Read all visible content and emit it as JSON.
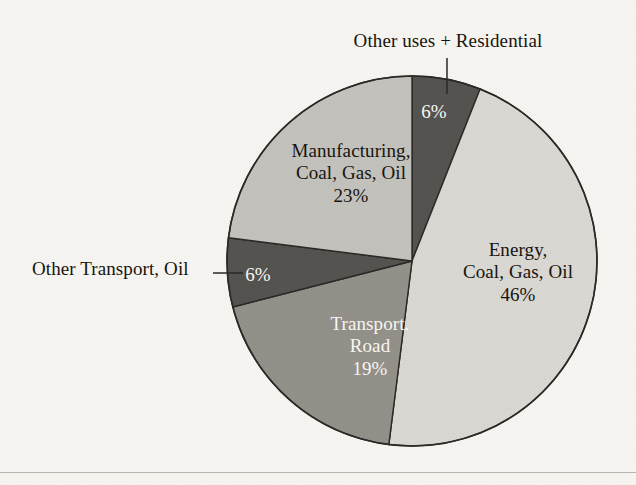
{
  "figure": {
    "background_color": "#f6f4f0",
    "outline_color": "#2c2a28"
  },
  "chart_data": {
    "type": "pie",
    "title": "",
    "units": "percent",
    "legend_position": "none",
    "labels_on_slices": true,
    "categories": [
      "Other uses + Residential",
      "Energy, Coal, Gas, Oil",
      "Transport. Road",
      "Other Transport, Oil",
      "Manufacturing, Coal, Gas, Oil"
    ],
    "values": [
      6,
      46,
      19,
      6,
      23
    ],
    "slice_colors": [
      "#555350",
      "#d9d7d2",
      "#939089",
      "#555350",
      "#c3c1bb"
    ],
    "slices": [
      {
        "name": "Other uses + Residential",
        "value": 6,
        "value_label": "6%",
        "color": "#555350",
        "text_color": "#f7f6f2",
        "label_placement": "outside-leader",
        "label_lines": [
          "Other uses + Residential"
        ]
      },
      {
        "name": "Energy, Coal, Gas, Oil",
        "value": 46,
        "value_label": "46%",
        "color": "#d9d7d2",
        "text_color": "#17150f",
        "label_placement": "inside",
        "label_lines": [
          "Energy,",
          "Coal, Gas, Oil",
          "46%"
        ]
      },
      {
        "name": "Transport. Road",
        "value": 19,
        "value_label": "19%",
        "color": "#939089",
        "text_color": "#f7f6f2",
        "label_placement": "inside",
        "label_lines": [
          "Transport.",
          "Road",
          "19%"
        ]
      },
      {
        "name": "Other Transport, Oil",
        "value": 6,
        "value_label": "6%",
        "color": "#555350",
        "text_color": "#f7f6f2",
        "label_placement": "outside-leader",
        "label_lines": [
          "Other Transport, Oil"
        ]
      },
      {
        "name": "Manufacturing, Coal, Gas, Oil",
        "value": 23,
        "value_label": "23%",
        "color": "#c3c1bb",
        "text_color": "#17150f",
        "label_placement": "inside",
        "label_lines": [
          "Manufacturing,",
          "Coal, Gas, Oil",
          "23%"
        ]
      }
    ]
  },
  "labels": {
    "other_uses_residential": {
      "line1": "Other uses + Residential",
      "value": "6%"
    },
    "manufacturing": {
      "line1": "Manufacturing,",
      "line2": "Coal, Gas, Oil",
      "value": "23%"
    },
    "energy": {
      "line1": "Energy,",
      "line2": "Coal, Gas, Oil",
      "value": "46%"
    },
    "transport_road": {
      "line1": "Transport.",
      "line2": "Road",
      "value": "19%"
    },
    "other_transport_oil": {
      "line1": "Other Transport, Oil",
      "value": "6%"
    }
  }
}
